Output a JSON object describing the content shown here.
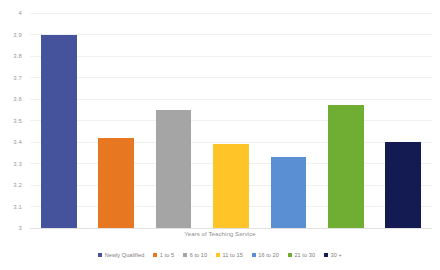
{
  "chart_data": {
    "type": "bar",
    "title": "",
    "xlabel": "Years of Teaching Service",
    "ylabel": "",
    "ylim": [
      3,
      4
    ],
    "ytick_step": 0.1,
    "yticks": [
      "4",
      "3.9",
      "3.8",
      "3.7",
      "3.6",
      "3.5",
      "3.4",
      "3.3",
      "3.2",
      "3.1",
      "3"
    ],
    "grid": true,
    "legend_position": "bottom",
    "categories": [
      "Newly Qualified",
      "1 to 5",
      "6 to 10",
      "11 to 15",
      "16 to 20",
      "21 to 30",
      "30 +"
    ],
    "values": [
      3.9,
      3.42,
      3.55,
      3.39,
      3.33,
      3.57,
      3.4
    ],
    "colors": [
      "#44539b",
      "#e87722",
      "#a5a5a5",
      "#ffc528",
      "#5b8fd4",
      "#70ad33",
      "#141a52"
    ],
    "series": [
      {
        "name": "Years of Teaching Service",
        "values": [
          3.9,
          3.42,
          3.55,
          3.39,
          3.33,
          3.57,
          3.4
        ]
      }
    ]
  },
  "legend": {
    "items": [
      {
        "label": "Newly Qualified",
        "color": "#44539b"
      },
      {
        "label": "1 to 5",
        "color": "#e87722"
      },
      {
        "label": "6 to 10",
        "color": "#a5a5a5"
      },
      {
        "label": "11 to 15",
        "color": "#ffc528"
      },
      {
        "label": "16 to 20",
        "color": "#5b8fd4"
      },
      {
        "label": "21 to 30",
        "color": "#70ad33"
      },
      {
        "label": "30 +",
        "color": "#141a52"
      }
    ]
  },
  "axis": {
    "x_title": "Years of Teaching Service"
  }
}
